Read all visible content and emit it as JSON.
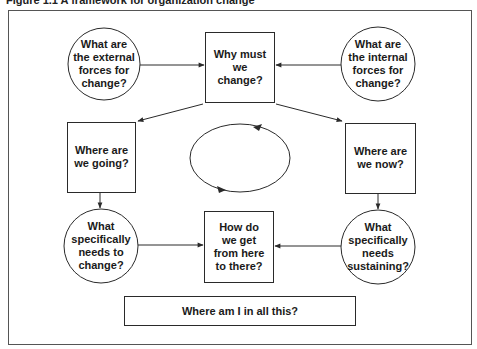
{
  "figure": {
    "title": "Figure 1.1 A framework for organization change"
  },
  "nodes": {
    "external_forces": {
      "shape": "circle",
      "text": "What are\nthe external\nforces for\nchange?"
    },
    "why_change": {
      "shape": "box",
      "text": "Why must\nwe\nchange?"
    },
    "internal_forces": {
      "shape": "circle",
      "text": "What are\nthe internal\nforces for\nchange?"
    },
    "where_going": {
      "shape": "box",
      "text": "Where are\nwe going?"
    },
    "where_now": {
      "shape": "box",
      "text": "Where are\nwe now?"
    },
    "needs_change": {
      "shape": "circle",
      "text": "What\nspecifically\nneeds to\nchange?"
    },
    "how_get_there": {
      "shape": "box",
      "text": "How do\nwe get\nfrom here\nto there?"
    },
    "needs_sustaining": {
      "shape": "circle",
      "text": "What\nspecifically\nneeds\nsustaining?"
    },
    "where_am_i": {
      "shape": "box",
      "text": "Where am I in all this?"
    }
  },
  "edges": [
    {
      "from": "external_forces",
      "to": "why_change"
    },
    {
      "from": "internal_forces",
      "to": "why_change"
    },
    {
      "from": "why_change",
      "to": "where_going"
    },
    {
      "from": "why_change",
      "to": "where_now"
    },
    {
      "from": "where_going",
      "to": "needs_change"
    },
    {
      "from": "where_now",
      "to": "needs_sustaining"
    },
    {
      "from": "needs_change",
      "to": "how_get_there"
    },
    {
      "from": "needs_sustaining",
      "to": "how_get_there"
    }
  ],
  "cycle": {
    "shape": "ellipse",
    "direction": "counterclockwise",
    "label": ""
  },
  "colors": {
    "stroke": "#2a2a2a",
    "background": "#ffffff",
    "text": "#1a1a1a"
  }
}
